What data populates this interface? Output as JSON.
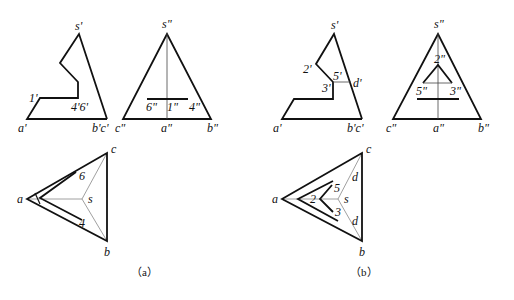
{
  "figure": {
    "panels": [
      {
        "id": "a",
        "caption": "（a）",
        "front_view": {
          "labels": {
            "s": "s'",
            "one": "1'",
            "four_six": "4'6'",
            "a": "a'",
            "bc": "b'c'"
          }
        },
        "side_view": {
          "labels": {
            "s": "s\"",
            "six": "6\"",
            "one": "1\"",
            "four": "4\"",
            "c": "c\"",
            "a": "a\"",
            "b": "b\""
          }
        },
        "top_view": {
          "labels": {
            "a": "a",
            "b": "b",
            "c": "c",
            "s": "s",
            "six": "6",
            "four": "4"
          }
        }
      },
      {
        "id": "b",
        "caption": "（b）",
        "front_view": {
          "labels": {
            "s": "s'",
            "two": "2'",
            "five": "5'",
            "three": "3'",
            "d": "d'",
            "a": "a'",
            "bc": "b'c'"
          }
        },
        "side_view": {
          "labels": {
            "s": "s\"",
            "two": "2\"",
            "five": "5\"",
            "three": "3\"",
            "c": "c\"",
            "a": "a\"",
            "b": "b\""
          }
        },
        "top_view": {
          "labels": {
            "a": "a",
            "b": "b",
            "c": "c",
            "s": "s",
            "two": "2",
            "five": "5",
            "three": "3",
            "d_upper": "d",
            "d_lower": "d"
          }
        }
      }
    ]
  }
}
